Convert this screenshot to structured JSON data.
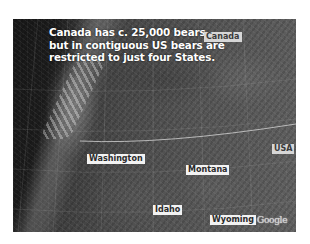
{
  "map": {
    "headline": {
      "line1": "Canada has c. 25,000 bears",
      "line2": "but in contiguous US bears are",
      "line3": "restricted to just four States."
    },
    "labels": {
      "canada": "Canada",
      "usa": "USA",
      "washington": "Washington",
      "montana": "Montana",
      "idaho": "Idaho",
      "wyoming": "Wyoming"
    },
    "attribution": "Google",
    "colors": {
      "label_bg": "#f2f2f2",
      "country_label_bg": "#d6d6d6",
      "headline_text": "#ffffff",
      "border_line": "#d9d9d9"
    }
  }
}
